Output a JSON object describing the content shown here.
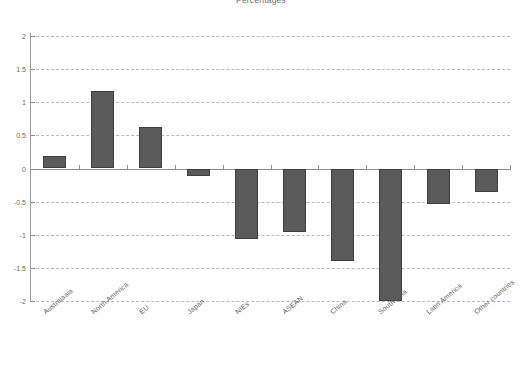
{
  "chart_data": {
    "type": "bar",
    "title": "Percentages",
    "xlabel": "",
    "ylabel": "",
    "ylim": [
      -2,
      2
    ],
    "yticks": [
      2,
      1.5,
      1,
      0.5,
      0,
      -0.5,
      -1,
      -1.5,
      -2
    ],
    "ytick_labels": [
      "2",
      "1.5",
      "1",
      "0.5",
      "0",
      "-0.5",
      "-1",
      "-1.5",
      "-2"
    ],
    "grid": true,
    "grid_style": "dashed horizontal",
    "legend": null,
    "bar_color": "#5a5a5a",
    "bar_edge_color": "#3f3f3f",
    "background_color": "#ffffff",
    "categories": [
      "Australasia",
      "North America",
      "EU",
      "Japan",
      "NIEs",
      "ASEAN",
      "China",
      "South Asia",
      "Latin America",
      "Other countries"
    ],
    "values": [
      0.19,
      1.17,
      0.62,
      -0.12,
      -1.06,
      -0.96,
      -1.39,
      -2.0,
      -0.54,
      -0.36
    ]
  }
}
